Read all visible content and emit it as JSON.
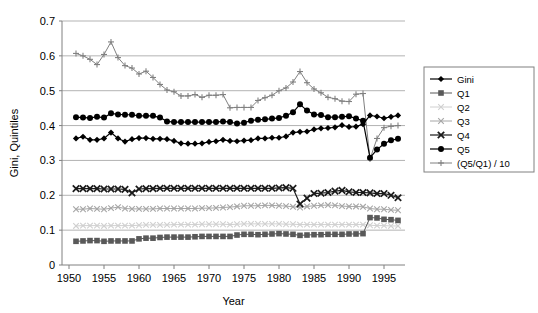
{
  "chart_data": {
    "type": "line",
    "title": "",
    "xlabel": "Year",
    "ylabel": "Gini, Quintiles",
    "xlim": [
      1949,
      1998
    ],
    "ylim": [
      0,
      0.7
    ],
    "xticks": [
      1950,
      1955,
      1960,
      1965,
      1970,
      1975,
      1980,
      1985,
      1990,
      1995
    ],
    "yticks": [
      0,
      0.1,
      0.2,
      0.3,
      0.4,
      0.5,
      0.6,
      0.7
    ],
    "ytick_labels": [
      "0",
      "0.1",
      "0.2",
      "0.3",
      "0.4",
      "0.5",
      "0.6",
      "0.7"
    ],
    "xtick_labels": [
      "1950",
      "1955",
      "1960",
      "1965",
      "1970",
      "1975",
      "1980",
      "1985",
      "1990",
      "1995"
    ],
    "grid": "horizontal",
    "legend_position": "right",
    "x": [
      1951,
      1952,
      1953,
      1954,
      1955,
      1956,
      1957,
      1958,
      1959,
      1960,
      1961,
      1962,
      1963,
      1964,
      1965,
      1966,
      1967,
      1968,
      1969,
      1970,
      1971,
      1972,
      1973,
      1974,
      1975,
      1976,
      1977,
      1978,
      1979,
      1980,
      1981,
      1982,
      1983,
      1984,
      1985,
      1986,
      1987,
      1988,
      1989,
      1990,
      1991,
      1992,
      1993,
      1994,
      1995,
      1996,
      1997
    ],
    "series": [
      {
        "name": "Gini",
        "marker": "diamond",
        "color": "#000000",
        "values": [
          0.363,
          0.368,
          0.359,
          0.359,
          0.363,
          0.38,
          0.363,
          0.354,
          0.361,
          0.364,
          0.364,
          0.362,
          0.362,
          0.361,
          0.356,
          0.349,
          0.348,
          0.348,
          0.349,
          0.353,
          0.355,
          0.359,
          0.356,
          0.355,
          0.357,
          0.358,
          0.363,
          0.363,
          0.365,
          0.365,
          0.369,
          0.38,
          0.382,
          0.383,
          0.389,
          0.392,
          0.393,
          0.395,
          0.401,
          0.396,
          0.397,
          0.404,
          0.429,
          0.426,
          0.421,
          0.425,
          0.429
        ]
      },
      {
        "name": "Q1",
        "marker": "square",
        "color": "#595959",
        "values": [
          0.068,
          0.069,
          0.07,
          0.07,
          0.068,
          0.069,
          0.069,
          0.069,
          0.069,
          0.075,
          0.077,
          0.077,
          0.079,
          0.08,
          0.08,
          0.08,
          0.08,
          0.081,
          0.082,
          0.082,
          0.082,
          0.082,
          0.082,
          0.086,
          0.088,
          0.088,
          0.087,
          0.088,
          0.089,
          0.09,
          0.089,
          0.088,
          0.085,
          0.086,
          0.087,
          0.087,
          0.088,
          0.088,
          0.088,
          0.089,
          0.089,
          0.09,
          0.136,
          0.135,
          0.131,
          0.13,
          0.128
        ]
      },
      {
        "name": "Q2",
        "marker": "x",
        "color": "#d0d0d0",
        "values": [
          0.112,
          0.113,
          0.113,
          0.113,
          0.112,
          0.113,
          0.113,
          0.113,
          0.113,
          0.114,
          0.115,
          0.115,
          0.115,
          0.115,
          0.116,
          0.116,
          0.116,
          0.116,
          0.117,
          0.117,
          0.117,
          0.117,
          0.116,
          0.117,
          0.118,
          0.118,
          0.118,
          0.118,
          0.118,
          0.118,
          0.117,
          0.117,
          0.116,
          0.116,
          0.116,
          0.116,
          0.116,
          0.116,
          0.116,
          0.116,
          0.116,
          0.116,
          0.114,
          0.113,
          0.113,
          0.112,
          0.112
        ]
      },
      {
        "name": "Q3",
        "marker": "x",
        "color": "#a6a6a6",
        "values": [
          0.16,
          0.16,
          0.162,
          0.161,
          0.16,
          0.163,
          0.166,
          0.162,
          0.161,
          0.161,
          0.161,
          0.161,
          0.162,
          0.162,
          0.162,
          0.162,
          0.162,
          0.162,
          0.163,
          0.163,
          0.164,
          0.165,
          0.166,
          0.168,
          0.17,
          0.17,
          0.17,
          0.171,
          0.171,
          0.17,
          0.169,
          0.167,
          0.165,
          0.168,
          0.17,
          0.171,
          0.172,
          0.171,
          0.169,
          0.168,
          0.168,
          0.167,
          0.162,
          0.16,
          0.16,
          0.158,
          0.157
        ]
      },
      {
        "name": "Q4",
        "marker": "x-bold",
        "color": "#1a1a1a",
        "values": [
          0.219,
          0.219,
          0.219,
          0.219,
          0.218,
          0.218,
          0.218,
          0.217,
          0.207,
          0.218,
          0.219,
          0.219,
          0.22,
          0.22,
          0.22,
          0.22,
          0.22,
          0.22,
          0.22,
          0.22,
          0.22,
          0.22,
          0.22,
          0.22,
          0.22,
          0.22,
          0.22,
          0.22,
          0.22,
          0.221,
          0.222,
          0.22,
          0.175,
          0.192,
          0.205,
          0.206,
          0.208,
          0.212,
          0.214,
          0.21,
          0.208,
          0.208,
          0.207,
          0.205,
          0.205,
          0.2,
          0.193
        ]
      },
      {
        "name": "Q5",
        "marker": "circle",
        "color": "#000000",
        "values": [
          0.424,
          0.423,
          0.422,
          0.425,
          0.423,
          0.435,
          0.432,
          0.431,
          0.431,
          0.428,
          0.428,
          0.428,
          0.423,
          0.412,
          0.41,
          0.41,
          0.41,
          0.41,
          0.41,
          0.41,
          0.41,
          0.412,
          0.41,
          0.406,
          0.408,
          0.414,
          0.417,
          0.418,
          0.42,
          0.422,
          0.428,
          0.438,
          0.461,
          0.443,
          0.432,
          0.43,
          0.424,
          0.424,
          0.425,
          0.427,
          0.42,
          0.414,
          0.308,
          0.331,
          0.348,
          0.358,
          0.362
        ]
      },
      {
        "name": "(Q5/Q1) / 10",
        "marker": "plus",
        "color": "#808080",
        "values": [
          0.607,
          0.6,
          0.59,
          0.575,
          0.604,
          0.64,
          0.595,
          0.572,
          0.565,
          0.548,
          0.556,
          0.538,
          0.518,
          0.502,
          0.497,
          0.485,
          0.485,
          0.489,
          0.481,
          0.487,
          0.487,
          0.489,
          0.451,
          0.452,
          0.452,
          0.452,
          0.472,
          0.48,
          0.487,
          0.5,
          0.508,
          0.525,
          0.555,
          0.523,
          0.505,
          0.494,
          0.481,
          0.477,
          0.47,
          0.469,
          0.49,
          0.492,
          0.304,
          0.363,
          0.394,
          0.398,
          0.4
        ]
      }
    ]
  },
  "legend": {
    "entries": [
      {
        "label": "Gini"
      },
      {
        "label": "Q1"
      },
      {
        "label": "Q2"
      },
      {
        "label": "Q3"
      },
      {
        "label": "Q4"
      },
      {
        "label": "Q5"
      },
      {
        "label": "(Q5/Q1) / 10"
      }
    ]
  }
}
